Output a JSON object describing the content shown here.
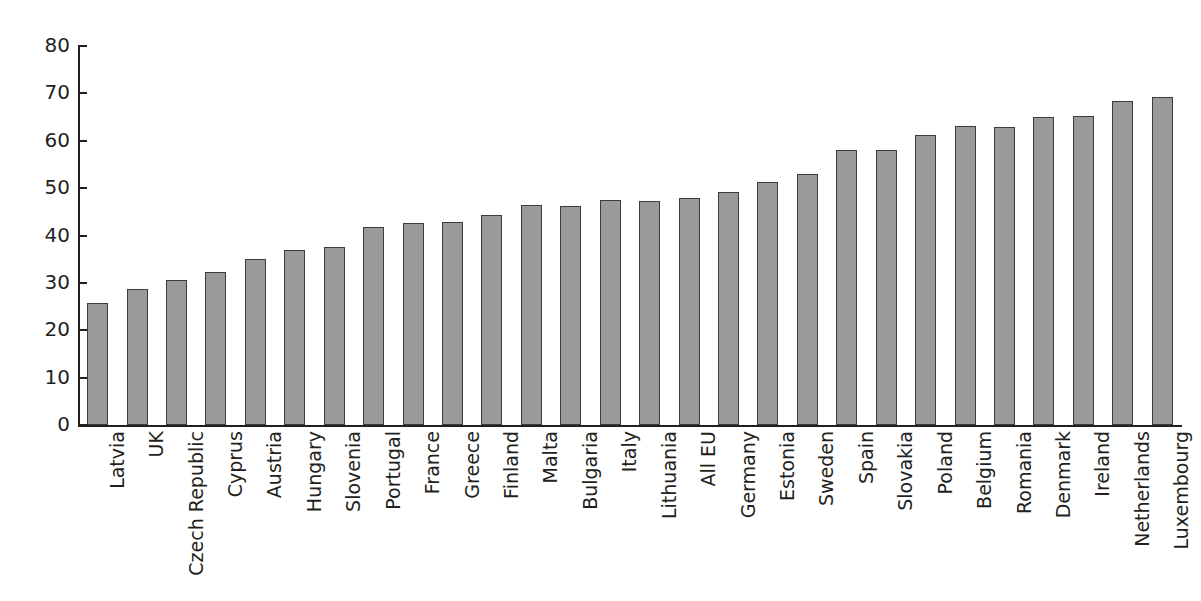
{
  "chart_data": {
    "type": "bar",
    "title": "",
    "subtitle": "",
    "xlabel": "",
    "ylabel": "",
    "ylim": [
      0,
      80
    ],
    "ytick_step": 10,
    "yticks": [
      "0",
      "10",
      "20",
      "30",
      "40",
      "50",
      "60",
      "70",
      "80"
    ],
    "grid": false,
    "legend": false,
    "bar_color": "#9a9a9a",
    "bar_border_color": "#3c3c3c",
    "axis_color": "#231f20",
    "background": "#ffffff",
    "categories": [
      "Latvia",
      "UK",
      "Czech Republic",
      "Cyprus",
      "Austria",
      "Hungary",
      "Slovenia",
      "Portugal",
      "France",
      "Greece",
      "Finland",
      "Malta",
      "Bulgaria",
      "Italy",
      "Lithuania",
      "All EU",
      "Germany",
      "Estonia",
      "Sweden",
      "Spain",
      "Slovakia",
      "Poland",
      "Belgium",
      "Romania",
      "Denmark",
      "Ireland",
      "Netherlands",
      "Luxembourg"
    ],
    "values": [
      25.8,
      28.8,
      30.6,
      32.2,
      35.0,
      37.0,
      37.6,
      41.7,
      42.7,
      42.9,
      44.3,
      46.4,
      46.3,
      47.4,
      47.2,
      47.9,
      49.1,
      51.4,
      52.9,
      58.1,
      58.1,
      61.2,
      63.2,
      62.9,
      65.0,
      65.2,
      68.3,
      69.2
    ]
  }
}
